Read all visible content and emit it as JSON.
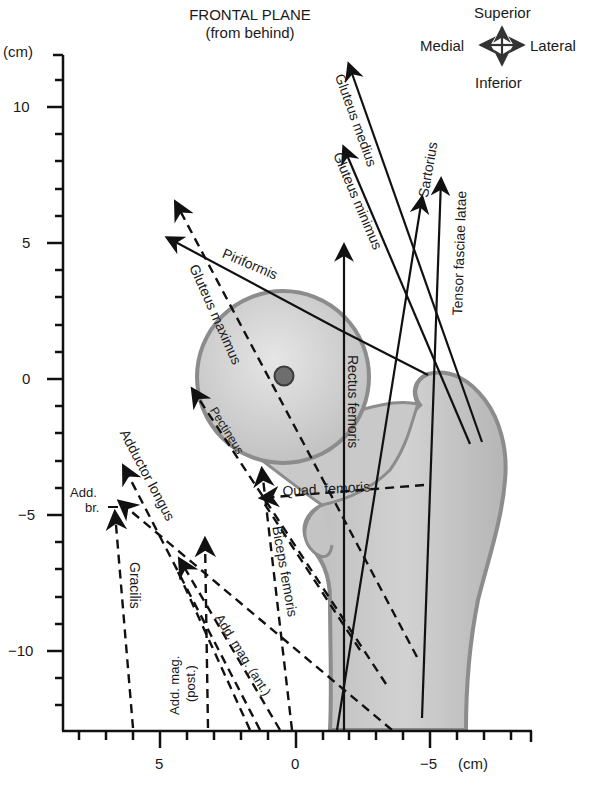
{
  "title": {
    "line1": "FRONTAL PLANE",
    "line2": "(from behind)"
  },
  "orientation": {
    "superior": "Superior",
    "inferior": "Inferior",
    "medial": "Medial",
    "lateral": "Lateral"
  },
  "axes": {
    "y_unit": "(cm)",
    "x_unit": "(cm)",
    "y_ticks": [
      {
        "value": 10,
        "label": "10"
      },
      {
        "value": 5,
        "label": "5"
      },
      {
        "value": 0,
        "label": "0"
      },
      {
        "value": -5,
        "label": "−5"
      },
      {
        "value": -10,
        "label": "−10"
      }
    ],
    "x_ticks": [
      {
        "value": 5,
        "label": "5"
      },
      {
        "value": 0,
        "label": "0"
      },
      {
        "value": -5,
        "label": "−5"
      }
    ]
  },
  "muscles": {
    "gluteus_medius": "Gluteus medius",
    "gluteus_minimus": "Gluteus minimus",
    "sartorius": "Sartorius",
    "tensor_fasciae_latae": "Tensor fasciae latae",
    "piriformis": "Piriformis",
    "gluteus_maximus": "Gluteus maximus",
    "rectus_femoris": "Rectus femoris",
    "pectineus": "Pectineus",
    "quad_femoris": "Quad. femoris",
    "adductor_longus": "Adductor longus",
    "add_br_line1": "Add.",
    "add_br_line2": "br.",
    "gracilis": "Gracilis",
    "biceps_femoris": "Biceps femoris",
    "add_mag_post_line1": "Add. mag.",
    "add_mag_post_line2": "(post.)",
    "add_mag_ant": "Add. mag. (ant.)"
  },
  "colors": {
    "bone_fill": "#c8c8c8",
    "bone_edge": "#8c8c8c",
    "center_dot": "#6e6e6e",
    "line": "#111111"
  }
}
